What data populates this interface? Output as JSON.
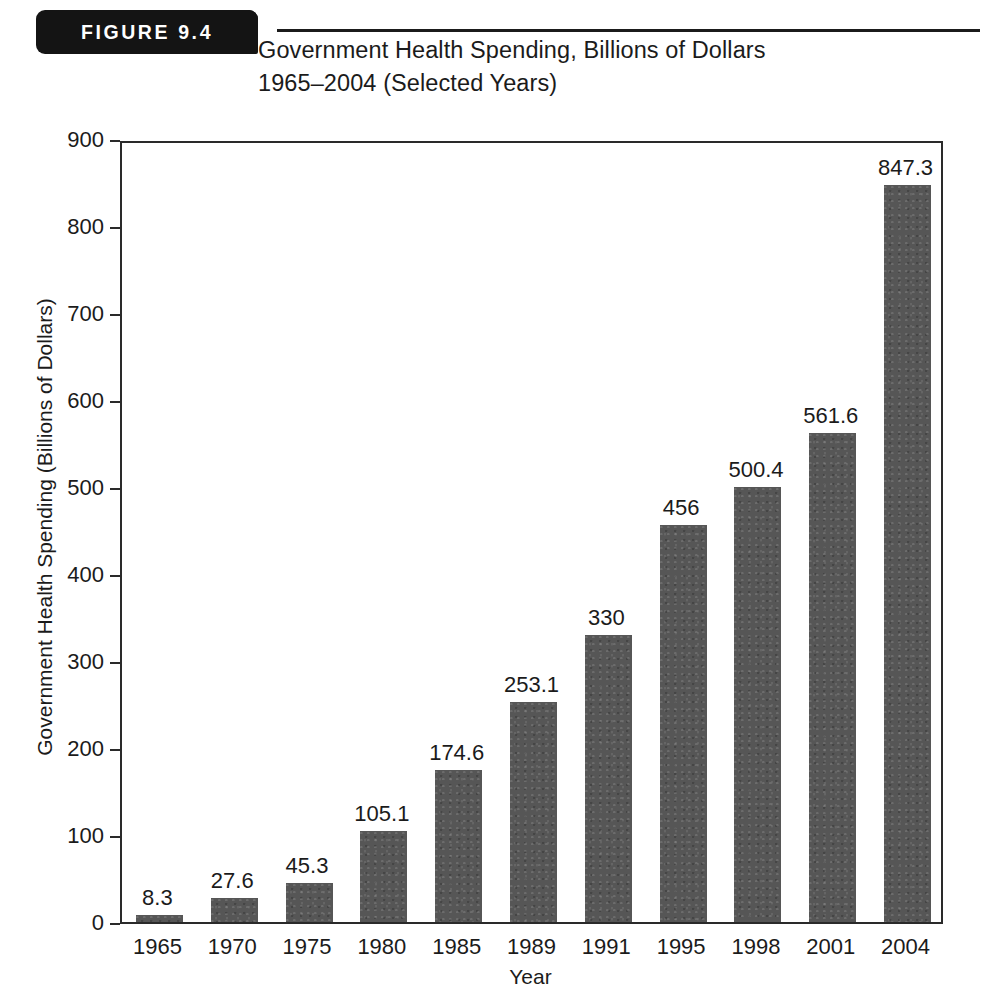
{
  "figure": {
    "badge_label": "FIGURE 9.4",
    "title_line1": "Government Health Spending, Billions of Dollars",
    "title_line2": "1965–2004 (Selected Years)"
  },
  "chart_data": {
    "type": "bar",
    "title": "Government Health Spending, Billions of Dollars 1965–2004 (Selected Years)",
    "xlabel": "Year",
    "ylabel": "Government Health Spending (Billions of Dollars)",
    "categories": [
      "1965",
      "1970",
      "1975",
      "1980",
      "1985",
      "1989",
      "1991",
      "1995",
      "1998",
      "2001",
      "2004"
    ],
    "values": [
      8.3,
      27.6,
      45.3,
      105.1,
      174.6,
      253.1,
      330,
      456,
      500.4,
      561.6,
      847.3
    ],
    "value_labels": [
      "8.3",
      "27.6",
      "45.3",
      "105.1",
      "174.6",
      "253.1",
      "330",
      "456",
      "500.4",
      "561.6",
      "847.3"
    ],
    "ylim": [
      0,
      900
    ],
    "yticks": [
      0,
      100,
      200,
      300,
      400,
      500,
      600,
      700,
      800,
      900
    ],
    "ytick_labels": [
      "0",
      "100",
      "200",
      "300",
      "400",
      "500",
      "600",
      "700",
      "800",
      "900"
    ],
    "grid": false,
    "legend": false,
    "bar_color": "#565656",
    "axis_color": "#2a2a2a",
    "text_color": "#1b1b1b",
    "background": "#ffffff"
  }
}
